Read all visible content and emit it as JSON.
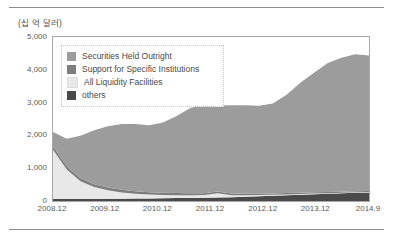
{
  "figure": {
    "unit_label": "(십 억 달러)"
  },
  "chart_data": {
    "type": "area",
    "stacked": true,
    "title": "",
    "subtitle": "",
    "xlabel": "",
    "ylabel": "(십 억 달러)",
    "ylim": [
      0,
      5000
    ],
    "yticks": [
      0,
      1000,
      2000,
      3000,
      4000,
      5000
    ],
    "ytick_labels": [
      "0",
      "1,000",
      "2,000",
      "3,000",
      "4,000",
      "5,000"
    ],
    "grid": false,
    "legend_position": "upper-left-inside",
    "xtick_labels": [
      "2008.12",
      "2009.12",
      "2010.12",
      "2011.12",
      "2012.12",
      "2013.12",
      "2014.9"
    ],
    "x": [
      "2008.12",
      "2009.03",
      "2009.06",
      "2009.09",
      "2009.12",
      "2010.03",
      "2010.06",
      "2010.09",
      "2010.12",
      "2011.03",
      "2011.06",
      "2011.09",
      "2011.12",
      "2012.03",
      "2012.06",
      "2012.09",
      "2012.12",
      "2013.03",
      "2013.06",
      "2013.09",
      "2013.12",
      "2014.03",
      "2014.06",
      "2014.09"
    ],
    "series": [
      {
        "name": "others",
        "color": "#4a4a4a",
        "values": [
          60,
          60,
          62,
          64,
          66,
          70,
          74,
          78,
          82,
          88,
          94,
          100,
          108,
          118,
          130,
          145,
          160,
          175,
          190,
          205,
          220,
          235,
          250,
          262
        ]
      },
      {
        "name": "All Liquidity Facilities",
        "color": "#e8e8e8",
        "values": [
          1500,
          900,
          540,
          360,
          260,
          190,
          150,
          120,
          100,
          90,
          85,
          80,
          130,
          60,
          45,
          35,
          30,
          26,
          24,
          22,
          20,
          18,
          16,
          15
        ]
      },
      {
        "name": "Support for Specific Institutions",
        "color": "#7d7d7d",
        "values": [
          110,
          100,
          95,
          90,
          86,
          80,
          76,
          72,
          68,
          64,
          60,
          56,
          54,
          50,
          46,
          44,
          42,
          40,
          38,
          36,
          34,
          32,
          30,
          28
        ]
      },
      {
        "name": "Securities Held Outright",
        "color": "#9c9c9c",
        "values": [
          430,
          840,
          1290,
          1640,
          1870,
          2010,
          2050,
          2040,
          2140,
          2350,
          2600,
          2710,
          2620,
          2690,
          2700,
          2680,
          2740,
          3000,
          3350,
          3650,
          3930,
          4080,
          4180,
          4130
        ]
      }
    ],
    "legend": [
      {
        "label": "Securities Held Outright",
        "color": "#9c9c9c"
      },
      {
        "label": "Support for Specific Institutions",
        "color": "#7d7d7d"
      },
      {
        "label": "All Liquidity Facilities",
        "color": "#e8e8e8"
      },
      {
        "label": "others",
        "color": "#4a4a4a"
      }
    ]
  }
}
